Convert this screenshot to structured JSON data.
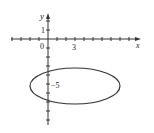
{
  "diagram": {
    "type": "coordinate-plane-ellipse",
    "axes": {
      "x_label": "x",
      "y_label": "y",
      "origin_label": "0",
      "x_tick_label": "3",
      "y_tick_label_pos": "1",
      "y_tick_label_neg": "−5"
    },
    "ellipse": {
      "center": [
        3,
        -5
      ],
      "semi_major_x": 5,
      "semi_minor_y": 2
    },
    "colors": {
      "stroke": "#333333",
      "background": "#ffffff"
    }
  }
}
